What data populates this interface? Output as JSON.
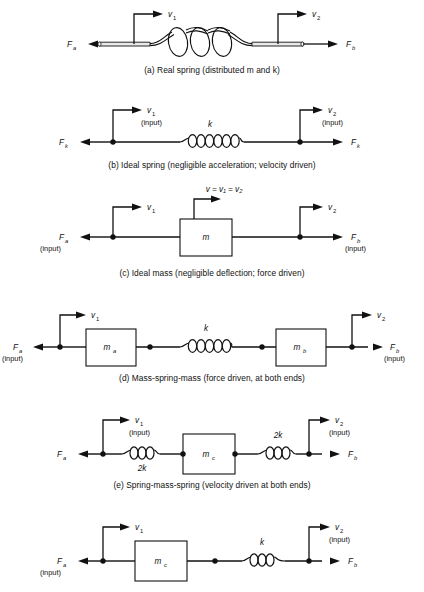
{
  "figure": {
    "panel_count": 6
  },
  "panels": [
    {
      "id": "a",
      "caption": "(a) Real spring (distributed m and k)",
      "type": "real-spring",
      "left_force": "F",
      "left_force_sub": "a",
      "right_force": "F",
      "right_force_sub": "b",
      "left_velocity": "v",
      "left_velocity_sub": "1",
      "right_velocity": "v",
      "right_velocity_sub": "2",
      "left_input": "",
      "right_input": "",
      "elements": [
        "helical coil spring with rod ends"
      ]
    },
    {
      "id": "b",
      "caption": "(b) Ideal spring (negligible acceleration; velocity driven)",
      "type": "ideal-spring",
      "left_force": "F",
      "left_force_sub": "k",
      "right_force": "F",
      "right_force_sub": "k",
      "left_velocity": "v",
      "left_velocity_sub": "1",
      "right_velocity": "v",
      "right_velocity_sub": "2",
      "left_input": "(input)",
      "right_input": "(input)",
      "spring_label": "k",
      "elements": [
        "spring k"
      ]
    },
    {
      "id": "c",
      "caption": "(c) Ideal mass (negligible deflection; force driven)",
      "type": "ideal-mass",
      "left_force": "F",
      "left_force_sub": "a",
      "right_force": "F",
      "right_force_sub": "b",
      "left_velocity": "v",
      "left_velocity_sub": "1",
      "right_velocity": "v",
      "right_velocity_sub": "2",
      "left_input": "(input)",
      "right_input": "(input)",
      "mass_label": "m",
      "mass_sub": "",
      "center_velocity": "v = v₁ = v₂",
      "elements": [
        "mass block m"
      ]
    },
    {
      "id": "d",
      "caption": "(d) Mass-spring-mass (force driven, at both ends)",
      "type": "mass-spring-mass",
      "left_force": "F",
      "left_force_sub": "a",
      "right_force": "F",
      "right_force_sub": "b",
      "left_velocity": "v",
      "left_velocity_sub": "1",
      "right_velocity": "v",
      "right_velocity_sub": "2",
      "left_input": "(input)",
      "right_input": "(input)",
      "mass_left": "m",
      "mass_left_sub": "a",
      "mass_right": "m",
      "mass_right_sub": "b",
      "spring_label": "k",
      "elements": [
        "mass m_a",
        "spring k",
        "mass m_b"
      ]
    },
    {
      "id": "e",
      "caption": "(e) Spring-mass-spring (velocity driven at both ends)",
      "type": "spring-mass-spring",
      "left_force": "F",
      "left_force_sub": "a",
      "right_force": "F",
      "right_force_sub": "b",
      "left_velocity": "v",
      "left_velocity_sub": "1",
      "right_velocity": "v",
      "right_velocity_sub": "2",
      "left_input": "(input)",
      "right_input": "(input)",
      "mass_label": "m",
      "mass_sub": "c",
      "spring_left_label": "2k",
      "spring_right_label": "2k",
      "elements": [
        "spring 2k",
        "mass m_c",
        "spring 2k"
      ]
    },
    {
      "id": "f",
      "caption": "",
      "type": "mass-spring",
      "left_force": "F",
      "left_force_sub": "a",
      "right_force": "F",
      "right_force_sub": "b",
      "left_velocity": "v",
      "left_velocity_sub": "1",
      "right_velocity": "v",
      "right_velocity_sub": "2",
      "left_input": "(input)",
      "right_input": "(input)",
      "mass_label": "m",
      "mass_sub": "c",
      "spring_label": "k",
      "elements": [
        "mass m_c",
        "spring k"
      ]
    }
  ],
  "colors": {
    "ink": "#111111",
    "background": "#ffffff"
  }
}
